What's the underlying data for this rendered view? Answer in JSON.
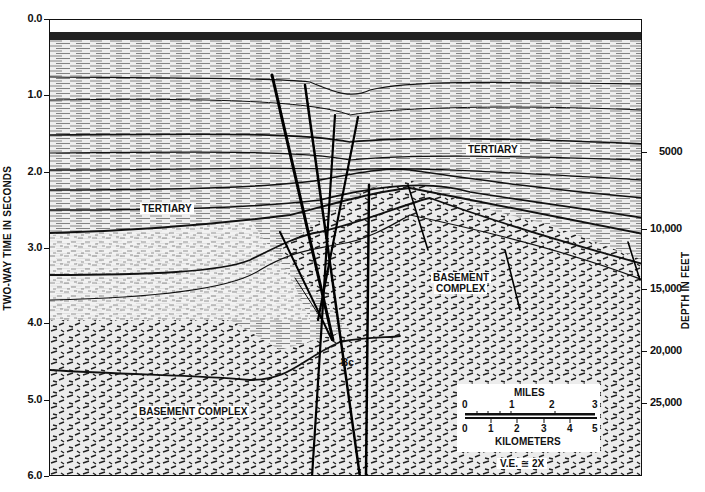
{
  "figure": {
    "type": "seismic-reflection-section",
    "background": "#ffffff",
    "ink": "#111111"
  },
  "axes": {
    "left": {
      "title": "TWO-WAY TIME IN SECONDS",
      "ticks": [
        "0.0",
        "1.0",
        "2.0",
        "3.0",
        "4.0",
        "5.0",
        "6.0"
      ]
    },
    "right": {
      "title": "DEPTH IN FEET",
      "ticks": [
        "5000",
        "10,000",
        "15,000",
        "20,000",
        "25,000"
      ]
    }
  },
  "labels": {
    "tertiary_right": "TERTIARY",
    "tertiary_left": "TERTIARY",
    "basement_right_line1": "BASEMENT",
    "basement_right_line2": "COMPLEX",
    "basement_left": "BASEMENT COMPLEX",
    "bc": "Bc"
  },
  "scale_bar": {
    "miles_label": "MILES",
    "miles_ticks": [
      "0",
      "1",
      "2",
      "3"
    ],
    "km_label": "KILOMETERS",
    "km_ticks": [
      "0",
      "1",
      "2",
      "3",
      "4",
      "5"
    ],
    "vertical_exaggeration": "V.E. ≅ 2X"
  }
}
